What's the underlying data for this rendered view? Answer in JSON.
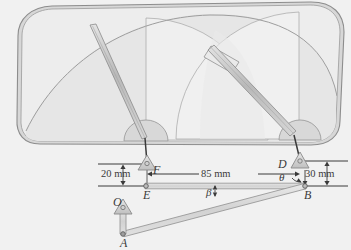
{
  "figure": {
    "background_color": "#f1f1f1",
    "line_color": "#6f6f6f",
    "glass_fill": "#ececec",
    "frame_fill": "#d9d9d9",
    "blade_fill": "#c9c9c9"
  },
  "labels": {
    "point_O": "O",
    "point_A": "A",
    "point_B": "B",
    "point_D": "D",
    "point_E": "E",
    "point_F": "F",
    "angle_theta": "θ",
    "angle_beta": "β"
  },
  "dimensions": {
    "left_offset": "20 mm",
    "span": "85 mm",
    "right_offset": "30 mm"
  },
  "diagram_data": {
    "type": "mechanism-diagram",
    "pivots": [
      {
        "name": "O",
        "x": 123,
        "y": 207,
        "kind": "fixed-bearing"
      },
      {
        "name": "F",
        "x": 146,
        "y": 164,
        "kind": "fixed-bearing"
      },
      {
        "name": "D",
        "x": 299,
        "y": 161,
        "kind": "fixed-bearing"
      },
      {
        "name": "A",
        "x": 123,
        "y": 234,
        "kind": "pin-joint"
      },
      {
        "name": "E",
        "x": 146,
        "y": 186,
        "kind": "pin-joint"
      },
      {
        "name": "B",
        "x": 305,
        "y": 186,
        "kind": "pin-joint"
      }
    ],
    "links": [
      {
        "name": "crank-OA",
        "from": "O",
        "to": "A"
      },
      {
        "name": "coupler-AB",
        "from": "A",
        "to": "B"
      },
      {
        "name": "connecting-rod-EB",
        "from": "E",
        "to": "B"
      },
      {
        "name": "wiper-arm-F",
        "from": "F",
        "to": "left-blade-pivot"
      },
      {
        "name": "wiper-arm-D",
        "from": "D",
        "to": "right-blade-pivot"
      }
    ],
    "dimension_values": {
      "left_offset_mm": 20,
      "span_mm": 85,
      "right_offset_mm": 30
    },
    "angles": [
      {
        "symbol": "θ",
        "at": "D",
        "between": [
          "DB",
          "vertical"
        ]
      },
      {
        "symbol": "β",
        "at": "B",
        "between": [
          "BE",
          "BA"
        ]
      }
    ]
  }
}
